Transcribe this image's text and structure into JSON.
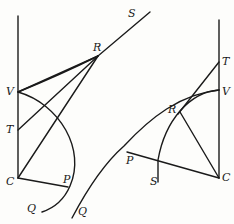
{
  "figure": {
    "left_diagram": {
      "labels": {
        "S": "S",
        "R": "R",
        "V": "V",
        "T": "T",
        "C": "C",
        "P": "P",
        "Q": "Q"
      }
    },
    "right_diagram": {
      "labels": {
        "T": "T",
        "V": "V",
        "R": "R",
        "P": "P",
        "S": "S",
        "C": "C",
        "Q": "Q"
      }
    },
    "stroke_color": "#1a1a1a",
    "background_color": "#fdfdfb"
  }
}
